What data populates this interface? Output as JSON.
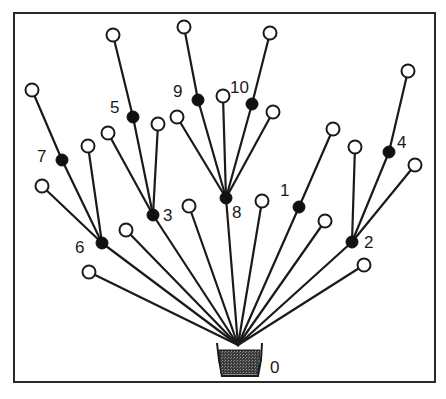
{
  "diagram": {
    "type": "tree",
    "colors": {
      "line": "#1a1a1a",
      "black_node": "#111111",
      "white_node": "#ffffff",
      "pot": "#555555"
    },
    "root": {
      "id": "0",
      "label": "0",
      "x": 238,
      "y": 345,
      "label_x": 270,
      "label_y": 373
    },
    "black_nodes": [
      {
        "id": "1",
        "label": "1",
        "x": 299,
        "y": 207,
        "label_x": 280,
        "label_y": 196,
        "parent": "0"
      },
      {
        "id": "2",
        "label": "2",
        "x": 352,
        "y": 242,
        "label_x": 364,
        "label_y": 248,
        "parent": "0"
      },
      {
        "id": "3",
        "label": "3",
        "x": 153,
        "y": 215,
        "label_x": 163,
        "label_y": 221,
        "parent": "0"
      },
      {
        "id": "4",
        "label": "4",
        "x": 389,
        "y": 152,
        "label_x": 397,
        "label_y": 148,
        "parent": "2"
      },
      {
        "id": "5",
        "label": "5",
        "x": 133,
        "y": 117,
        "label_x": 110,
        "label_y": 113,
        "parent": "3"
      },
      {
        "id": "6",
        "label": "6",
        "x": 102,
        "y": 243,
        "label_x": 75,
        "label_y": 253,
        "parent": "0"
      },
      {
        "id": "7",
        "label": "7",
        "x": 62,
        "y": 160,
        "label_x": 37,
        "label_y": 162,
        "parent": "6"
      },
      {
        "id": "8",
        "label": "8",
        "x": 226,
        "y": 198,
        "label_x": 232,
        "label_y": 218,
        "parent": "0"
      },
      {
        "id": "9",
        "label": "9",
        "x": 198,
        "y": 100,
        "label_x": 173,
        "label_y": 97,
        "parent": "8"
      },
      {
        "id": "10",
        "label": "10",
        "x": 252,
        "y": 104,
        "label_x": 230,
        "label_y": 93,
        "parent": "8"
      }
    ],
    "white_nodes": [
      {
        "x": 113,
        "y": 35,
        "parent": "5"
      },
      {
        "x": 184,
        "y": 27,
        "parent": "9"
      },
      {
        "x": 270,
        "y": 33,
        "parent": "10"
      },
      {
        "x": 32,
        "y": 90,
        "parent": "7"
      },
      {
        "x": 408,
        "y": 71,
        "parent": "4"
      },
      {
        "x": 223,
        "y": 96,
        "parent": "8"
      },
      {
        "x": 177,
        "y": 117,
        "parent": "8"
      },
      {
        "x": 273,
        "y": 112,
        "parent": "8"
      },
      {
        "x": 158,
        "y": 124,
        "parent": "3"
      },
      {
        "x": 108,
        "y": 133,
        "parent": "3"
      },
      {
        "x": 88,
        "y": 146,
        "parent": "6"
      },
      {
        "x": 42,
        "y": 186,
        "parent": "6"
      },
      {
        "x": 333,
        "y": 129,
        "parent": "1"
      },
      {
        "x": 355,
        "y": 147,
        "parent": "2"
      },
      {
        "x": 415,
        "y": 165,
        "parent": "2"
      },
      {
        "x": 89,
        "y": 272,
        "parent": "0"
      },
      {
        "x": 126,
        "y": 230,
        "parent": "0"
      },
      {
        "x": 189,
        "y": 206,
        "parent": "0"
      },
      {
        "x": 262,
        "y": 201,
        "parent": "0"
      },
      {
        "x": 325,
        "y": 221,
        "parent": "0"
      },
      {
        "x": 364,
        "y": 265,
        "parent": "0"
      }
    ]
  }
}
